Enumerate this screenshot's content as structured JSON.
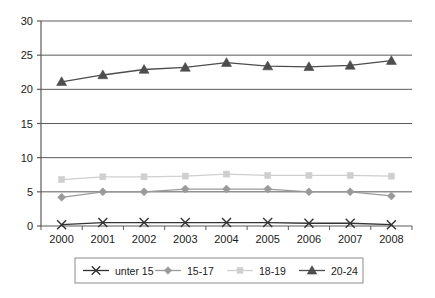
{
  "chart_data": {
    "type": "line",
    "title": "",
    "subtitle": "",
    "xlabel": "",
    "ylabel": "",
    "categories": [
      "2000",
      "2001",
      "2002",
      "2003",
      "2004",
      "2005",
      "2006",
      "2007",
      "2008"
    ],
    "ylim": [
      0,
      30
    ],
    "xlim_categories": true,
    "yticks": [
      0,
      5,
      10,
      15,
      20,
      25,
      30
    ],
    "ytick_labels": [
      "0",
      "5",
      "10",
      "15",
      "20",
      "25",
      "30"
    ],
    "grid": "horizontal",
    "legend_position": "bottom",
    "series": [
      {
        "name": "unter 15",
        "marker": "x-cross",
        "color": "#333333",
        "values": [
          0.2,
          0.5,
          0.5,
          0.5,
          0.5,
          0.5,
          0.4,
          0.4,
          0.2
        ]
      },
      {
        "name": "15-17",
        "marker": "diamond",
        "color": "#9a9a9a",
        "values": [
          4.2,
          5.0,
          5.0,
          5.4,
          5.4,
          5.4,
          5.0,
          5.0,
          4.4
        ]
      },
      {
        "name": "18-19",
        "marker": "square",
        "color": "#cfcfcf",
        "values": [
          6.8,
          7.2,
          7.2,
          7.3,
          7.6,
          7.4,
          7.4,
          7.4,
          7.3
        ]
      },
      {
        "name": "20-24",
        "marker": "triangle",
        "color": "#4d4d4d",
        "values": [
          21.1,
          22.1,
          22.9,
          23.2,
          23.9,
          23.4,
          23.3,
          23.5,
          24.2
        ]
      }
    ]
  },
  "axes": {
    "y_ticks": [
      {
        "label": "30",
        "value": 30
      },
      {
        "label": "25",
        "value": 25
      },
      {
        "label": "20",
        "value": 20
      },
      {
        "label": "15",
        "value": 15
      },
      {
        "label": "10",
        "value": 10
      },
      {
        "label": "5",
        "value": 5
      },
      {
        "label": "0",
        "value": 0
      }
    ],
    "x_ticks": [
      {
        "label": "2000"
      },
      {
        "label": "2001"
      },
      {
        "label": "2002"
      },
      {
        "label": "2003"
      },
      {
        "label": "2004"
      },
      {
        "label": "2005"
      },
      {
        "label": "2006"
      },
      {
        "label": "2007"
      },
      {
        "label": "2008"
      }
    ]
  },
  "legend": {
    "entries": [
      {
        "label": "unter 15",
        "marker": "x-cross",
        "color": "#333333"
      },
      {
        "label": "15-17",
        "marker": "diamond",
        "color": "#9a9a9a"
      },
      {
        "label": "18-19",
        "marker": "square",
        "color": "#cfcfcf"
      },
      {
        "label": "20-24",
        "marker": "triangle",
        "color": "#4d4d4d"
      }
    ]
  },
  "colors": {
    "background": "#ffffff",
    "grid": "#5a5a5a",
    "axis": "#5a5a5a",
    "legend_border": "#8c8c8c",
    "text": "#1a1a1a"
  }
}
